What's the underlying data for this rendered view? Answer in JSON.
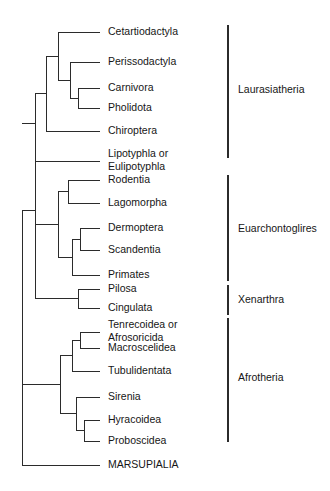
{
  "figure": {
    "type": "phylogenetic-tree",
    "orientation": "left-to-right",
    "background_color": "#ffffff",
    "line_color": "#2b2b2b",
    "text_color": "#161616"
  },
  "taxa": [
    {
      "id": "cetartiodactyla",
      "label": "Cetartiodactyla",
      "line2": "",
      "y": 32,
      "tip_x": 100,
      "clade": "Laurasiatheria"
    },
    {
      "id": "perissodactyla",
      "label": "Perissodactyla",
      "line2": "",
      "y": 62,
      "tip_x": 100,
      "clade": "Laurasiatheria"
    },
    {
      "id": "carnivora",
      "label": "Carnivora",
      "line2": "",
      "y": 88,
      "tip_x": 100,
      "clade": "Laurasiatheria"
    },
    {
      "id": "pholidota",
      "label": "Pholidota",
      "line2": "",
      "y": 108,
      "tip_x": 100,
      "clade": "Laurasiatheria"
    },
    {
      "id": "chiroptera",
      "label": "Chiroptera",
      "line2": "",
      "y": 131,
      "tip_x": 100,
      "clade": "Laurasiatheria"
    },
    {
      "id": "lipotyphla",
      "label": "Lipotyphla or",
      "line2": "Eulipotyphla",
      "y": 154,
      "tip_x": 100,
      "clade": "Laurasiatheria"
    },
    {
      "id": "rodentia",
      "label": "Rodentia",
      "line2": "",
      "y": 180,
      "tip_x": 100,
      "clade": "Euarchontoglires"
    },
    {
      "id": "lagomorpha",
      "label": "Lagomorpha",
      "line2": "",
      "y": 203,
      "tip_x": 100,
      "clade": "Euarchontoglires"
    },
    {
      "id": "dermoptera",
      "label": "Dermoptera",
      "line2": "",
      "y": 228,
      "tip_x": 100,
      "clade": "Euarchontoglires"
    },
    {
      "id": "scandentia",
      "label": "Scandentia",
      "line2": "",
      "y": 250,
      "tip_x": 100,
      "clade": "Euarchontoglires"
    },
    {
      "id": "primates",
      "label": "Primates",
      "line2": "",
      "y": 275,
      "tip_x": 100,
      "clade": "Euarchontoglires"
    },
    {
      "id": "pilosa",
      "label": "Pilosa",
      "line2": "",
      "y": 289,
      "tip_x": 100,
      "clade": "Xenarthra"
    },
    {
      "id": "cingulata",
      "label": "Cingulata",
      "line2": "",
      "y": 308,
      "tip_x": 100,
      "clade": "Xenarthra"
    },
    {
      "id": "tenrecoidea",
      "label": "Tenrecoidea or",
      "line2": "Afrosoricida",
      "y": 325,
      "tip_x": 100,
      "clade": "Afrotheria"
    },
    {
      "id": "macroscelidea",
      "label": "Macroscelidea",
      "line2": "",
      "y": 348,
      "tip_x": 100,
      "clade": "Afrotheria"
    },
    {
      "id": "tubulidentata",
      "label": "Tubulidentata",
      "line2": "",
      "y": 371,
      "tip_x": 100,
      "clade": "Afrotheria"
    },
    {
      "id": "sirenia",
      "label": "Sirenia",
      "line2": "",
      "y": 397,
      "tip_x": 100,
      "clade": "Afrotheria"
    },
    {
      "id": "hyracoidea",
      "label": "Hyracoidea",
      "line2": "",
      "y": 420,
      "tip_x": 100,
      "clade": "Afrotheria"
    },
    {
      "id": "proboscidea",
      "label": "Proboscidea",
      "line2": "",
      "y": 441,
      "tip_x": 100,
      "clade": "Afrotheria"
    },
    {
      "id": "marsupialia",
      "label": "MARSUPIALIA",
      "line2": "",
      "y": 465,
      "tip_x": 100,
      "clade": ""
    }
  ],
  "nodes": [
    {
      "id": "n-carnivora-pholidota",
      "x": 78,
      "y_top": 88,
      "y_bottom": 108,
      "stem_to_x": 70
    },
    {
      "id": "n-perisso-carn-phol",
      "x": 70,
      "y_top": 62,
      "y_bottom": 98,
      "stem_to_x": 58
    },
    {
      "id": "n-cetart-group",
      "x": 58,
      "y_top": 32,
      "y_bottom": 80,
      "stem_to_x": 46
    },
    {
      "id": "n-chiroptera-join",
      "x": 46,
      "y_top": 56,
      "y_bottom": 131,
      "stem_to_x": 35
    },
    {
      "id": "n-laurasiatheria",
      "x": 35,
      "y_top": 93,
      "y_bottom": 154,
      "stem_to_x": 22
    },
    {
      "id": "n-rodentia-lagomorpha",
      "x": 68,
      "y_top": 180,
      "y_bottom": 203,
      "stem_to_x": 58
    },
    {
      "id": "n-dermo-scandentia",
      "x": 80,
      "y_top": 228,
      "y_bottom": 250,
      "stem_to_x": 72
    },
    {
      "id": "n-dermo-scand-primates",
      "x": 72,
      "y_top": 239,
      "y_bottom": 275,
      "stem_to_x": 58
    },
    {
      "id": "n-euarchontoglires",
      "x": 58,
      "y_top": 191,
      "y_bottom": 257,
      "stem_to_x": 35
    },
    {
      "id": "n-xenarthra",
      "x": 78,
      "y_top": 289,
      "y_bottom": 308,
      "stem_to_x": 35
    },
    {
      "id": "n-boreoeutheria",
      "x": 35,
      "y_top": 123,
      "y_bottom": 298,
      "stem_to_x": 22
    },
    {
      "id": "n-tenrec-macro",
      "x": 80,
      "y_top": 332,
      "y_bottom": 348,
      "stem_to_x": 72
    },
    {
      "id": "n-afroinsectiphilia",
      "x": 72,
      "y_top": 340,
      "y_bottom": 371,
      "stem_to_x": 60
    },
    {
      "id": "n-hyrac-probos",
      "x": 84,
      "y_top": 420,
      "y_bottom": 441,
      "stem_to_x": 76
    },
    {
      "id": "n-paenungulata",
      "x": 76,
      "y_top": 397,
      "y_bottom": 430,
      "stem_to_x": 60
    },
    {
      "id": "n-afrotheria",
      "x": 60,
      "y_top": 355,
      "y_bottom": 413,
      "stem_to_x": 22
    },
    {
      "id": "n-root",
      "x": 22,
      "y_top": 210,
      "y_bottom": 465,
      "stem_to_x": 22
    }
  ],
  "clades": [
    {
      "id": "laurasiatheria",
      "label": "Laurasiatheria",
      "bar_x": 228,
      "bar_y_top": 25,
      "bar_y_bottom": 158,
      "label_x": 238,
      "label_y": 90
    },
    {
      "id": "euarchontoglires",
      "label": "Euarchontoglires",
      "bar_x": 228,
      "bar_y_top": 175,
      "bar_y_bottom": 281,
      "label_x": 238,
      "label_y": 229
    },
    {
      "id": "xenarthra",
      "label": "Xenarthra",
      "bar_x": 228,
      "bar_y_top": 285,
      "bar_y_bottom": 315,
      "label_x": 238,
      "label_y": 300
    },
    {
      "id": "afrotheria",
      "label": "Afrotheria",
      "bar_x": 228,
      "bar_y_top": 318,
      "bar_y_bottom": 442,
      "label_x": 238,
      "label_y": 378
    }
  ],
  "label_x": 108,
  "line_height": 13
}
